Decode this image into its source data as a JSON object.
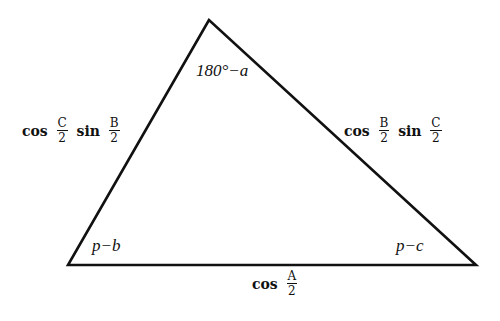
{
  "diagram": {
    "type": "triangle",
    "vertices": {
      "top": {
        "x": 209,
        "y": 20
      },
      "bottom_left": {
        "x": 68,
        "y": 265
      },
      "bottom_right": {
        "x": 476,
        "y": 265
      }
    },
    "stroke_color": "#111111",
    "angle_labels": {
      "top": "180°−a",
      "bottom_left": "p−b",
      "bottom_right": "p−c"
    },
    "side_labels": {
      "left": {
        "f1": "cos",
        "n1": "C",
        "d1": "2",
        "f2": "sin",
        "n2": "B",
        "d2": "2"
      },
      "right": {
        "f1": "cos",
        "n1": "B",
        "d1": "2",
        "f2": "sin",
        "n2": "C",
        "d2": "2"
      },
      "bottom": {
        "f1": "cos",
        "n1": "A",
        "d1": "2"
      }
    }
  }
}
